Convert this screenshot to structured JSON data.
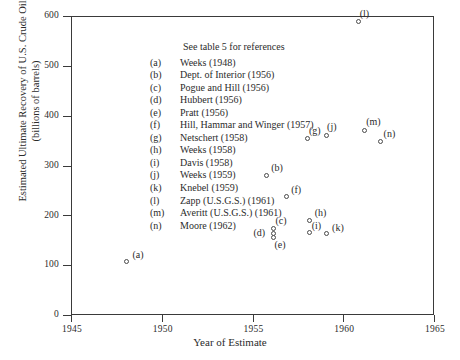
{
  "chart_data": {
    "type": "scatter",
    "title": "",
    "xlabel": "Year of Estimate",
    "ylabel_line1": "Estimated Ultimate Recovery of U.S. Crude Oil",
    "ylabel_line2": "(billions of barrels)",
    "xlim": [
      1945,
      1965
    ],
    "ylim": [
      0,
      600
    ],
    "xticks": [
      1945,
      1950,
      1955,
      1960,
      1965
    ],
    "xtick_labels": [
      "1945",
      "1950",
      "1955",
      "1960",
      "1965"
    ],
    "yticks": [
      0,
      100,
      200,
      300,
      400,
      500,
      600
    ],
    "ytick_labels": [
      "0",
      "100",
      "200",
      "300",
      "400",
      "500",
      "600"
    ],
    "grid": false,
    "legend_position": "upper-left-inside",
    "annotation": "See table 5 for references",
    "points": [
      {
        "key": "(a)",
        "x": 1948.0,
        "y": 110,
        "label_dx": 6,
        "label_dy": -12
      },
      {
        "key": "(b)",
        "x": 1955.7,
        "y": 282,
        "label_dx": 5,
        "label_dy": -13
      },
      {
        "key": "(c)",
        "x": 1956.1,
        "y": 175,
        "label_dx": 2,
        "label_dy": -14
      },
      {
        "key": "(d)",
        "x": 1956.1,
        "y": 165,
        "label_dx": -20,
        "label_dy": -7
      },
      {
        "key": "(e)",
        "x": 1956.1,
        "y": 158,
        "label_dx": 1,
        "label_dy": 2
      },
      {
        "key": "(f)",
        "x": 1956.8,
        "y": 239,
        "label_dx": 5,
        "label_dy": -13
      },
      {
        "key": "(g)",
        "x": 1958.0,
        "y": 357,
        "label_dx": 1,
        "label_dy": -13
      },
      {
        "key": "(h)",
        "x": 1958.1,
        "y": 192,
        "label_dx": 5,
        "label_dy": -13
      },
      {
        "key": "(i)",
        "x": 1958.1,
        "y": 167,
        "label_dx": 2,
        "label_dy": -13
      },
      {
        "key": "(j)",
        "x": 1959.0,
        "y": 363,
        "label_dx": 1,
        "label_dy": -14
      },
      {
        "key": "(k)",
        "x": 1959.0,
        "y": 165,
        "label_dx": 6,
        "label_dy": -12
      },
      {
        "key": "(l)",
        "x": 1960.8,
        "y": 590,
        "label_dx": 1,
        "label_dy": -14
      },
      {
        "key": "(m)",
        "x": 1961.1,
        "y": 373,
        "label_dx": 2,
        "label_dy": -14
      },
      {
        "key": "(n)",
        "x": 1962.0,
        "y": 350,
        "label_dx": 3,
        "label_dy": -14
      }
    ]
  },
  "legend": {
    "title": "See table 5 for references",
    "entries": [
      {
        "key": "(a)",
        "text": "Weeks (1948)"
      },
      {
        "key": "(b)",
        "text": "Dept. of Interior (1956)"
      },
      {
        "key": "(c)",
        "text": "Pogue and Hill (1956)"
      },
      {
        "key": "(d)",
        "text": "Hubbert (1956)"
      },
      {
        "key": "(e)",
        "text": "Pratt (1956)"
      },
      {
        "key": "(f)",
        "text": "Hill, Hammar and Winger (1957)"
      },
      {
        "key": "(g)",
        "text": "Netschert (1958)"
      },
      {
        "key": "(h)",
        "text": "Weeks (1958)"
      },
      {
        "key": "(i)",
        "text": "Davis (1958)"
      },
      {
        "key": "(j)",
        "text": "Weeks (1959)"
      },
      {
        "key": "(k)",
        "text": "Knebel (1959)"
      },
      {
        "key": "(l)",
        "text": "Zapp (U.S.G.S.) (1961)"
      },
      {
        "key": "(m)",
        "text": "Averitt (U.S.G.S.) (1961)"
      },
      {
        "key": "(n)",
        "text": "Moore (1962)"
      }
    ]
  }
}
